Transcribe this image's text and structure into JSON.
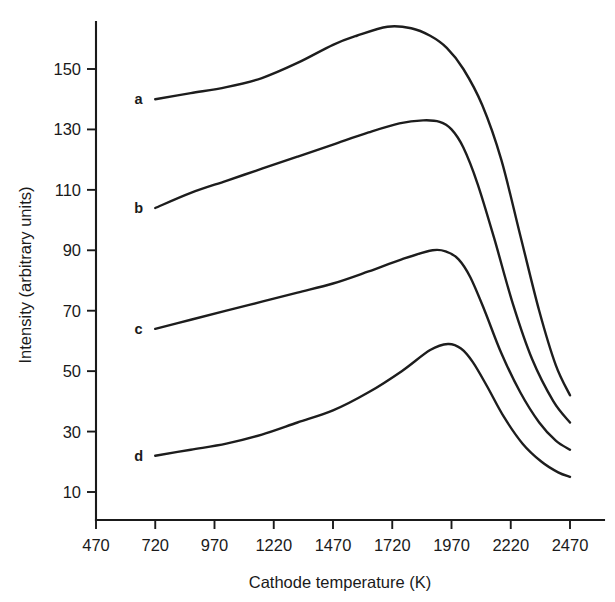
{
  "chart_data": {
    "type": "line",
    "title": "",
    "xlabel": "Cathode temperature (K)",
    "ylabel": "Intensity (arbitrary units)",
    "xlim": [
      470,
      2590
    ],
    "ylim": [
      2,
      172
    ],
    "xticks": [
      470,
      720,
      970,
      1220,
      1470,
      1720,
      1970,
      2220,
      2470
    ],
    "xticklabels": [
      "470",
      "720",
      "970",
      "1220",
      "1470",
      "1720",
      "1970",
      "2220",
      "2470"
    ],
    "yticks": [
      10,
      30,
      50,
      70,
      90,
      110,
      130,
      150
    ],
    "yticklabels": [
      "10",
      "30",
      "50",
      "70",
      "90",
      "110",
      "130",
      "150"
    ],
    "grid": false,
    "legend": "inline-curve-labels",
    "series": [
      {
        "name": "a",
        "label": "a",
        "label_x": 650,
        "label_y": 140,
        "color": "#1d1d1d",
        "x": [
          720,
          870,
          1020,
          1170,
          1320,
          1470,
          1570,
          1700,
          1800,
          1880,
          1950,
          2020,
          2100,
          2180,
          2260,
          2340,
          2410,
          2470
        ],
        "y": [
          140,
          142,
          144,
          147,
          152,
          158,
          161,
          164,
          163.5,
          161,
          157,
          150,
          138,
          120,
          95,
          70,
          52,
          42
        ]
      },
      {
        "name": "b",
        "label": "b",
        "label_x": 650,
        "label_y": 104,
        "color": "#1d1d1d",
        "x": [
          720,
          870,
          1020,
          1170,
          1320,
          1470,
          1620,
          1750,
          1850,
          1920,
          1970,
          2020,
          2080,
          2150,
          2230,
          2310,
          2400,
          2470
        ],
        "y": [
          104,
          109,
          113,
          117,
          121,
          125,
          129,
          132,
          133,
          132.5,
          130,
          124,
          112,
          94,
          72,
          54,
          40,
          33
        ]
      },
      {
        "name": "c",
        "label": "c",
        "label_x": 650,
        "label_y": 64,
        "color": "#1d1d1d",
        "x": [
          720,
          870,
          1020,
          1170,
          1320,
          1470,
          1620,
          1760,
          1890,
          1950,
          2000,
          2050,
          2110,
          2180,
          2260,
          2340,
          2410,
          2470
        ],
        "y": [
          64,
          67,
          70,
          73,
          76,
          79,
          83,
          87,
          90,
          89.5,
          87,
          81,
          70,
          56,
          43,
          33,
          27,
          24
        ]
      },
      {
        "name": "d",
        "label": "d",
        "label_x": 650,
        "label_y": 22,
        "color": "#1d1d1d",
        "x": [
          720,
          870,
          1020,
          1170,
          1320,
          1470,
          1620,
          1760,
          1880,
          1955,
          2010,
          2060,
          2120,
          2190,
          2270,
          2350,
          2420,
          2470
        ],
        "y": [
          22,
          24,
          26,
          29,
          33,
          37,
          43,
          50,
          57,
          59,
          57.5,
          53,
          45,
          35,
          26,
          20,
          16.5,
          15
        ]
      }
    ]
  }
}
